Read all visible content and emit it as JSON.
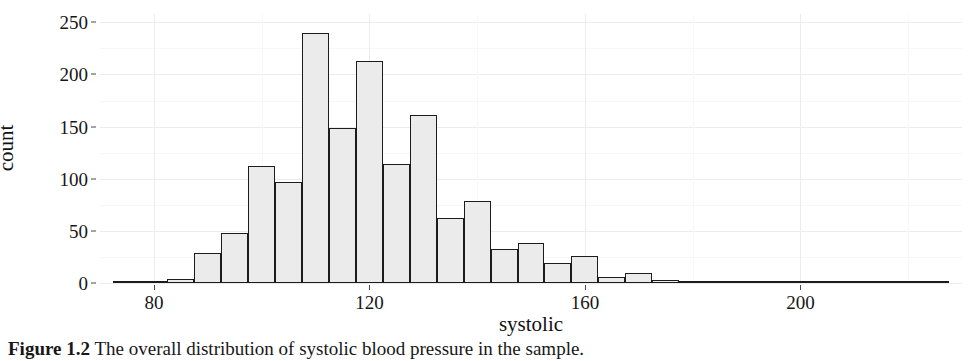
{
  "chart_data": {
    "type": "bar",
    "subtype": "histogram",
    "title": "",
    "xlabel": "systolic",
    "ylabel": "count",
    "xlim": [
      70,
      230
    ],
    "ylim": [
      0,
      258
    ],
    "binwidth": 5,
    "grid": true,
    "legend": "none",
    "xticks": [
      80,
      120,
      160,
      200
    ],
    "yticks": [
      0,
      50,
      100,
      150,
      200,
      250
    ],
    "yticks_minor": [
      25,
      75,
      125,
      175,
      225
    ],
    "bar_fill": "#ebebeb",
    "bar_border": "#1c1c1c",
    "panel_background": "#ffffff",
    "gridline_color": "#ececec",
    "bin_starts": [
      72.5,
      77.5,
      82.5,
      87.5,
      92.5,
      97.5,
      102.5,
      107.5,
      112.5,
      117.5,
      122.5,
      127.5,
      132.5,
      137.5,
      142.5,
      147.5,
      152.5,
      157.5,
      162.5,
      167.5,
      172.5,
      177.5,
      182.5,
      187.5,
      192.5,
      197.5,
      202.5,
      207.5,
      212.5,
      217.5,
      222.5
    ],
    "values": [
      1,
      2,
      4,
      29,
      48,
      112,
      97,
      240,
      149,
      213,
      114,
      161,
      62,
      79,
      33,
      38,
      19,
      26,
      6,
      10,
      3,
      2,
      1,
      0,
      1,
      1,
      0,
      0,
      1,
      0,
      1
    ],
    "categories": [
      "72.5",
      "77.5",
      "82.5",
      "87.5",
      "92.5",
      "97.5",
      "102.5",
      "107.5",
      "112.5",
      "117.5",
      "122.5",
      "127.5",
      "132.5",
      "137.5",
      "142.5",
      "147.5",
      "152.5",
      "157.5",
      "162.5",
      "167.5",
      "172.5",
      "177.5",
      "182.5",
      "187.5",
      "192.5",
      "197.5",
      "202.5",
      "207.5",
      "212.5",
      "217.5",
      "222.5"
    ]
  },
  "axes": {
    "y_title": "count",
    "x_title": "systolic",
    "y_tick_labels": [
      "0",
      "50",
      "100",
      "150",
      "200",
      "250"
    ],
    "x_tick_labels": [
      "80",
      "120",
      "160",
      "200"
    ]
  },
  "caption": {
    "label": "Figure 1.2",
    "text": "The overall distribution of systolic blood pressure in the sample."
  }
}
